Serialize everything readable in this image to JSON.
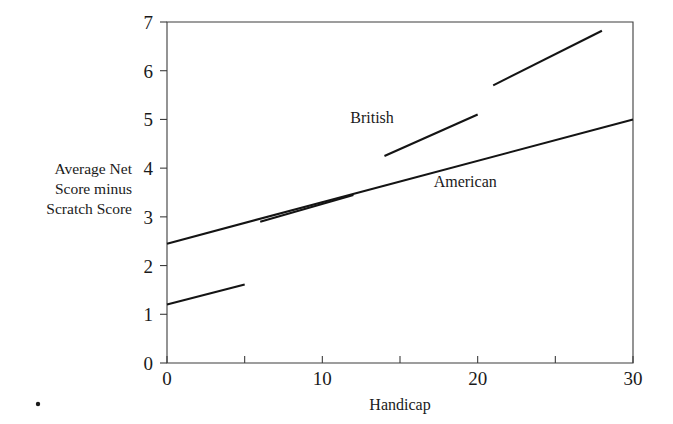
{
  "chart_data": {
    "type": "line",
    "title": "",
    "xlabel": "Handicap",
    "ylabel": "Average Net Score minus Scratch Score",
    "ylabel_lines": [
      "Average Net",
      "Score minus",
      "Scratch Score"
    ],
    "xlim": [
      0,
      30
    ],
    "ylim": [
      0,
      7
    ],
    "grid": false,
    "legend": "inline-annotations",
    "x_ticks": [
      0,
      5,
      10,
      15,
      20,
      25,
      30
    ],
    "x_tick_labels": [
      "0",
      "",
      "10",
      "",
      "20",
      "",
      "30"
    ],
    "y_ticks": [
      0,
      1,
      2,
      3,
      4,
      5,
      6,
      7
    ],
    "y_tick_labels": [
      "0",
      "1",
      "2",
      "3",
      "4",
      "5",
      "6",
      "7"
    ],
    "series": [
      {
        "name": "American",
        "label": "American",
        "label_x": 19.2,
        "label_y": 3.62,
        "points": [
          [
            0,
            2.45
          ],
          [
            30,
            5.0
          ]
        ]
      },
      {
        "name": "British",
        "label": "British",
        "label_x": 13.2,
        "label_y": 4.92,
        "points": [
          [
            14.0,
            4.25
          ],
          [
            20.0,
            5.1
          ]
        ]
      },
      {
        "name": "British upper segment",
        "label": "",
        "points": [
          [
            21.0,
            5.7
          ],
          [
            28.0,
            6.82
          ]
        ]
      },
      {
        "name": "British lower segment",
        "label": "",
        "points": [
          [
            0.0,
            1.2
          ],
          [
            5.0,
            1.61
          ]
        ]
      },
      {
        "name": "British middle segment",
        "label": "",
        "points": [
          [
            6.0,
            2.9
          ],
          [
            12.0,
            3.45
          ]
        ]
      }
    ],
    "axis_color": "#3d3d3d",
    "line_color": "#141414",
    "background_color": "#ffffff",
    "frame": {
      "left": 167,
      "right": 633,
      "top": 22,
      "bottom": 363
    },
    "marks": [
      {
        "name": "corner-dot",
        "x": 38,
        "y": 404,
        "r": 2.2
      }
    ]
  }
}
